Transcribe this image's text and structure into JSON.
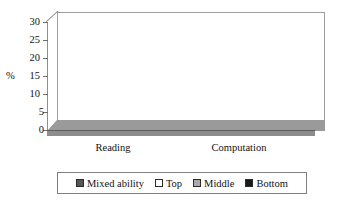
{
  "chart_data": {
    "type": "bar",
    "title": "",
    "subtitle": "",
    "xlabel": "",
    "ylabel": "%",
    "ylim": [
      0,
      30
    ],
    "yticks": [
      0,
      5,
      10,
      15,
      20,
      25,
      30
    ],
    "ytick_labels": [
      "0",
      "5",
      "10",
      "15",
      "20",
      "25",
      "30"
    ],
    "categories": [
      "Reading",
      "Computation"
    ],
    "grid": false,
    "legend_position": "bottom",
    "style": "3d-clustered-column",
    "series": [
      {
        "name": "Mixed ability",
        "color": "#555555",
        "values": [
          26,
          3.5
        ]
      },
      {
        "name": "Top",
        "color": "#ffffff",
        "values": [
          21,
          5
        ]
      },
      {
        "name": "Middle",
        "color": "#aaaaaa",
        "values": [
          10,
          3.5
        ]
      },
      {
        "name": "Bottom",
        "color": "#1a1a1a",
        "values": [
          10.5,
          2.5
        ]
      }
    ]
  },
  "axis": {
    "unit_label": "%",
    "ticks": [
      {
        "value": "30"
      },
      {
        "value": "25"
      },
      {
        "value": "20"
      },
      {
        "value": "15"
      },
      {
        "value": "10"
      },
      {
        "value": "5"
      },
      {
        "value": "0"
      }
    ]
  },
  "categories": [
    {
      "label": "Reading"
    },
    {
      "label": "Computation"
    }
  ],
  "legend": {
    "items": [
      {
        "label": "Mixed ability",
        "swatch": "dark-gray-swatch"
      },
      {
        "label": "Top",
        "swatch": "white-swatch"
      },
      {
        "label": "Middle",
        "swatch": "light-gray-swatch"
      },
      {
        "label": "Bottom",
        "swatch": "black-swatch"
      }
    ]
  }
}
